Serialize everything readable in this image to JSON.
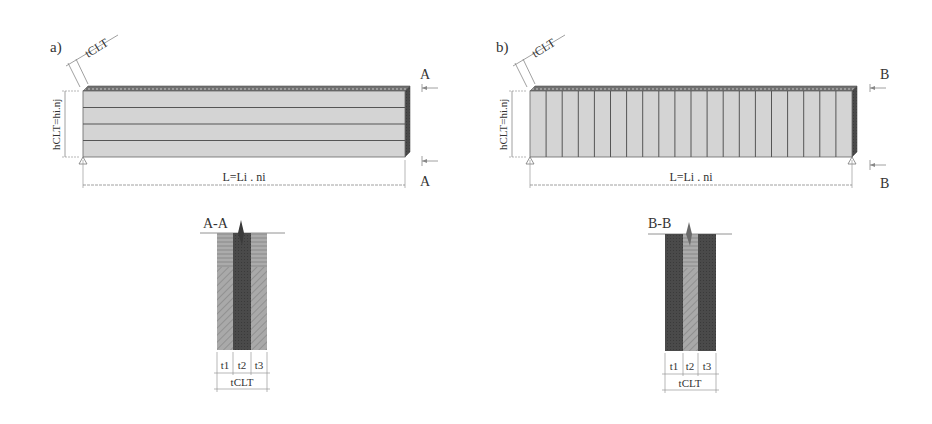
{
  "panel_a": {
    "label": "a)",
    "thickness_label": "tCLT",
    "height_label": "hCLT=hi.nj",
    "length_label": "L=Li . ni",
    "section_mark_top": "A",
    "section_mark_bottom": "A",
    "lamella_count": 4,
    "section": {
      "title": "A-A",
      "layer_labels": [
        "t1",
        "t2",
        "t3"
      ],
      "total_label": "tCLT"
    }
  },
  "panel_b": {
    "label": "b)",
    "thickness_label": "tCLT",
    "height_label": "hCLT=hi.nj",
    "length_label": "L=Li . ni",
    "section_mark_top": "B",
    "section_mark_bottom": "B",
    "board_count": 20,
    "section": {
      "title": "B-B",
      "layer_labels": [
        "t1",
        "t2",
        "t3"
      ],
      "total_label": "tCLT"
    }
  },
  "colors": {
    "beam_face": "#d4d4d4",
    "beam_top": "#6a6a6a",
    "lines": "#555555",
    "dim_lines": "#888888",
    "section_light": "#a8a8a8",
    "section_dark": "#4a4a4a"
  }
}
